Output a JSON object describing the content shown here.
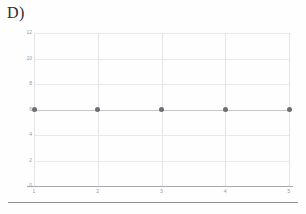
{
  "panel": {
    "label": "D)"
  },
  "chart_data": {
    "type": "scatter",
    "title": "",
    "xlabel": "",
    "ylabel": "",
    "x": [
      1,
      2,
      3,
      4,
      5
    ],
    "values": [
      6,
      6,
      6,
      6,
      6
    ],
    "series": [
      {
        "name": "",
        "values": [
          6,
          6,
          6,
          6,
          6
        ]
      }
    ],
    "xlim": [
      1,
      5
    ],
    "ylim": [
      0,
      12
    ],
    "xticks": [
      "1",
      "2",
      "3",
      "4",
      "5"
    ],
    "yticks": [
      "0",
      "2",
      "4",
      "6",
      "8",
      "10",
      "12"
    ],
    "grid": true,
    "legend": false,
    "marker_color": "#6e6e73",
    "line_color": "#c6c6cb",
    "grid_color": "#e9e9ec",
    "axis_color": "#a9a9ad",
    "tick_label_color": "#9a9aa0"
  }
}
